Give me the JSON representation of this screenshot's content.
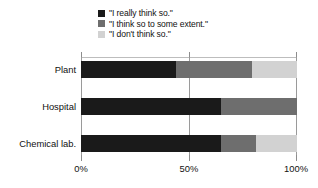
{
  "chart_data": {
    "type": "bar",
    "orientation": "horizontal",
    "stacked": true,
    "title": "",
    "xlabel": "",
    "ylabel": "",
    "xlim": [
      0,
      100
    ],
    "xticks": [
      0,
      50,
      100
    ],
    "xtick_labels": [
      "0%",
      "50%",
      "100%"
    ],
    "grid": true,
    "legend_position": "top",
    "categories": [
      "Plant",
      "Hospital",
      "Chemical lab."
    ],
    "series": [
      {
        "name": "\"I really think so.\"",
        "color": "#1a1a1a",
        "values": [
          44,
          65,
          65
        ]
      },
      {
        "name": "\"I think so to some extent.\"",
        "color": "#6e6e6e",
        "values": [
          35,
          35,
          16
        ]
      },
      {
        "name": "\"I don't think so.\"",
        "color": "#d2d2d2",
        "values": [
          21,
          0,
          19
        ]
      }
    ]
  },
  "legend": {
    "items": [
      {
        "label": "\"I really think so.\"",
        "swatch": "#1a1a1a"
      },
      {
        "label": "\"I think so to some extent.\"",
        "swatch": "#6e6e6e"
      },
      {
        "label": "\"I don't think so.\"",
        "swatch": "#d2d2d2"
      }
    ]
  },
  "axis": {
    "tick_labels": [
      "0%",
      "50%",
      "100%"
    ]
  },
  "categories": {
    "labels": [
      "Plant",
      "Hospital",
      "Chemical lab."
    ]
  },
  "colors": {
    "series_1": "#1a1a1a",
    "series_2": "#6e6e6e",
    "series_3": "#d2d2d2",
    "axis": "#9a9a9a",
    "background": "#ffffff"
  }
}
